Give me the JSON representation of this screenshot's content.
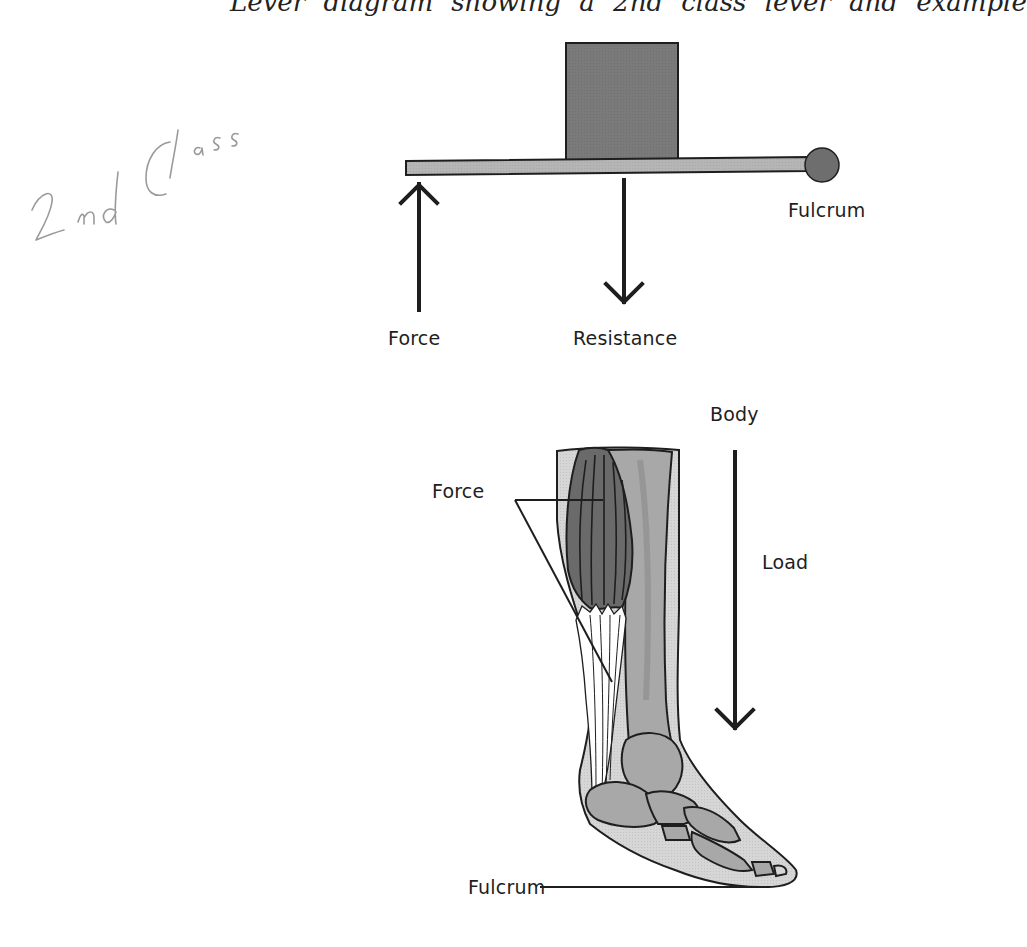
{
  "header": {
    "cropped_title_fragment": "Lever diagram showing a 2nd class lever and example"
  },
  "annotation": {
    "handwritten_note": "2nd Class"
  },
  "lever_diagram": {
    "labels": {
      "force": "Force",
      "resistance": "Resistance",
      "fulcrum": "Fulcrum"
    },
    "colors": {
      "bar": "#b5b5b5",
      "load_box": "#7a7a7a",
      "fulcrum_ball": "#6e6e6e",
      "outline": "#1e1e1e"
    }
  },
  "anatomy_diagram": {
    "labels": {
      "force": "Force",
      "body": "Body",
      "load": "Load",
      "fulcrum": "Fulcrum"
    },
    "colors": {
      "skin": "#d6d6d6",
      "muscle": "#6a6a6a",
      "bone": "#a8a8a8",
      "tendon": "#ffffff"
    }
  }
}
